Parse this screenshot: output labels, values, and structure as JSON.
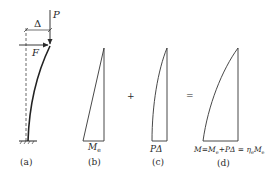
{
  "colors": {
    "ink": "#2a2a2a",
    "background": "#ffffff"
  },
  "panels": {
    "a": {
      "caption": "(a)",
      "delta_label": "Δ",
      "load_p_label": "P",
      "load_f_label": "F"
    },
    "b": {
      "caption": "(b)",
      "moment_label_main": "M",
      "moment_label_sub": "e"
    },
    "c": {
      "caption": "(c)",
      "moment_label": "PΔ"
    },
    "d": {
      "caption": "(d)",
      "equation_parts": {
        "m": "M",
        "eq1": "=",
        "me": "M",
        "me_sub": "e",
        "plus_pdelta": "+PΔ",
        "eq2": " = ",
        "eta": "η",
        "eta_sub": "e",
        "me2": "M",
        "me2_sub": "e"
      }
    }
  },
  "operators": {
    "plus": "+",
    "equals": "="
  }
}
